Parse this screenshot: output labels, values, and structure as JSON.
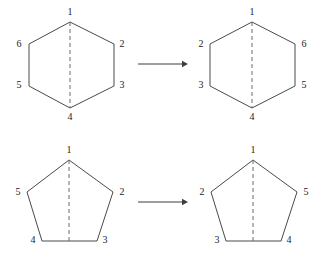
{
  "figure": {
    "background_color": "#ffffff",
    "stroke_color": "#4a4a4a",
    "dash_color": "#6b6b6b",
    "label_color": "#1c1c1c",
    "rows": [
      {
        "name": "hexagon-row",
        "shape": "hexagon",
        "sides": 6,
        "before": {
          "name": "hexagon-before",
          "labels": [
            "1",
            "2",
            "3",
            "4",
            "5",
            "6"
          ],
          "label_order_clockwise_from_top": [
            "1",
            "2",
            "3",
            "4",
            "5",
            "6"
          ]
        },
        "after": {
          "name": "hexagon-after",
          "labels": [
            "1",
            "6",
            "5",
            "4",
            "3",
            "2"
          ],
          "label_order_clockwise_from_top": [
            "1",
            "6",
            "5",
            "4",
            "3",
            "2"
          ]
        },
        "arrow": {
          "name": "transform-arrow-hexagon",
          "direction": "right"
        }
      },
      {
        "name": "pentagon-row",
        "shape": "pentagon",
        "sides": 5,
        "before": {
          "name": "pentagon-before",
          "labels": [
            "1",
            "2",
            "3",
            "4",
            "5"
          ],
          "label_order_clockwise_from_top": [
            "1",
            "2",
            "3",
            "4",
            "5"
          ]
        },
        "after": {
          "name": "pentagon-after",
          "labels": [
            "1",
            "5",
            "4",
            "3",
            "2"
          ],
          "label_order_clockwise_from_top": [
            "1",
            "5",
            "4",
            "3",
            "2"
          ]
        },
        "arrow": {
          "name": "transform-arrow-pentagon",
          "direction": "right"
        }
      }
    ]
  },
  "chart_data": {
    "type": "diagram",
    "panels": [
      {
        "id": "hexagon-left",
        "shape": "hexagon",
        "vertices": [
          {
            "label": "1",
            "x": 70,
            "y": 22,
            "label_x": 70,
            "label_y": 13,
            "position": "top"
          },
          {
            "label": "2",
            "x": 114,
            "y": 44,
            "label_x": 122,
            "label_y": 45,
            "position": "upper-right"
          },
          {
            "label": "3",
            "x": 114,
            "y": 86,
            "label_x": 122,
            "label_y": 86,
            "position": "lower-right"
          },
          {
            "label": "4",
            "x": 70,
            "y": 108,
            "label_x": 70,
            "label_y": 118,
            "position": "bottom"
          },
          {
            "label": "5",
            "x": 29,
            "y": 86,
            "label_x": 19,
            "label_y": 86,
            "position": "lower-left"
          },
          {
            "label": "6",
            "x": 29,
            "y": 44,
            "label_x": 19,
            "label_y": 45,
            "position": "upper-left"
          }
        ],
        "mirror_axis": {
          "x1": 70,
          "y1": 22,
          "x2": 70,
          "y2": 108,
          "style": "dashed",
          "orientation": "vertical"
        }
      },
      {
        "id": "hexagon-right",
        "shape": "hexagon",
        "vertices": [
          {
            "label": "1",
            "x": 252,
            "y": 22,
            "label_x": 252,
            "label_y": 13,
            "position": "top"
          },
          {
            "label": "6",
            "x": 295,
            "y": 44,
            "label_x": 304,
            "label_y": 45,
            "position": "upper-right"
          },
          {
            "label": "5",
            "x": 295,
            "y": 86,
            "label_x": 304,
            "label_y": 86,
            "position": "lower-right"
          },
          {
            "label": "4",
            "x": 252,
            "y": 108,
            "label_x": 252,
            "label_y": 118,
            "position": "bottom"
          },
          {
            "label": "3",
            "x": 210,
            "y": 86,
            "label_x": 201,
            "label_y": 86,
            "position": "lower-left"
          },
          {
            "label": "2",
            "x": 210,
            "y": 44,
            "label_x": 201,
            "label_y": 45,
            "position": "upper-left"
          }
        ],
        "mirror_axis": {
          "x1": 252,
          "y1": 22,
          "x2": 252,
          "y2": 108,
          "style": "dashed",
          "orientation": "vertical"
        }
      },
      {
        "id": "pentagon-left",
        "shape": "pentagon",
        "vertices": [
          {
            "label": "1",
            "x": 69,
            "y": 160,
            "label_x": 69,
            "label_y": 151,
            "position": "top"
          },
          {
            "label": "2",
            "x": 113,
            "y": 192,
            "label_x": 122,
            "label_y": 193,
            "position": "right"
          },
          {
            "label": "3",
            "x": 97,
            "y": 241,
            "label_x": 105,
            "label_y": 241,
            "position": "lower-right"
          },
          {
            "label": "4",
            "x": 42,
            "y": 241,
            "label_x": 33,
            "label_y": 241,
            "position": "lower-left"
          },
          {
            "label": "5",
            "x": 27,
            "y": 192,
            "label_x": 18,
            "label_y": 193,
            "position": "left"
          }
        ],
        "mirror_axis": {
          "x1": 69,
          "y1": 160,
          "x2": 69,
          "y2": 241,
          "style": "dashed",
          "orientation": "vertical"
        }
      },
      {
        "id": "pentagon-right",
        "shape": "pentagon",
        "vertices": [
          {
            "label": "1",
            "x": 253,
            "y": 160,
            "label_x": 253,
            "label_y": 151,
            "position": "top"
          },
          {
            "label": "5",
            "x": 297,
            "y": 192,
            "label_x": 306,
            "label_y": 193,
            "position": "right"
          },
          {
            "label": "4",
            "x": 281,
            "y": 241,
            "label_x": 289,
            "label_y": 241,
            "position": "lower-right"
          },
          {
            "label": "3",
            "x": 226,
            "y": 241,
            "label_x": 217,
            "label_y": 241,
            "position": "lower-left"
          },
          {
            "label": "2",
            "x": 211,
            "y": 192,
            "label_x": 202,
            "label_y": 193,
            "position": "left"
          }
        ],
        "mirror_axis": {
          "x1": 253,
          "y1": 160,
          "x2": 253,
          "y2": 241,
          "style": "dashed",
          "orientation": "vertical"
        }
      }
    ],
    "arrows": [
      {
        "id": "arrow-top",
        "x1": 138,
        "y1": 64,
        "x2": 188,
        "y2": 64,
        "direction": "right"
      },
      {
        "id": "arrow-bottom",
        "x1": 138,
        "y1": 202,
        "x2": 188,
        "y2": 202,
        "direction": "right"
      }
    ]
  }
}
